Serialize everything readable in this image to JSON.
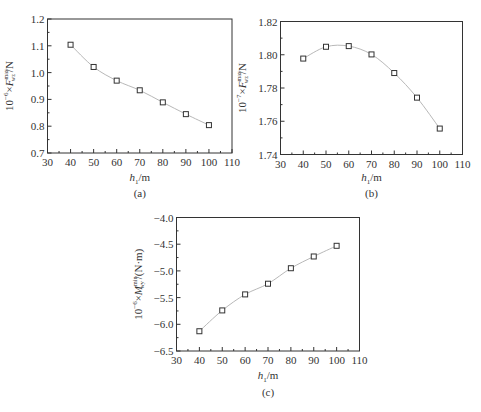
{
  "chart_data": [
    {
      "id": "a",
      "type": "line",
      "caption": "(a)",
      "xlabel": "h1/m",
      "xlabel_main": "h",
      "xlabel_sub": "1",
      "xlabel_unit": "/m",
      "ylabel": "10^-6 × F^max_wz / N",
      "ylabel_prefix": "10",
      "ylabel_exp": "−6",
      "ylabel_sym": "F",
      "ylabel_sup": "max",
      "ylabel_sub": "wz",
      "ylabel_unit": "/N",
      "xlim": [
        30,
        110
      ],
      "ylim": [
        0.7,
        1.2
      ],
      "xticks": [
        30,
        40,
        50,
        60,
        70,
        80,
        90,
        100,
        110
      ],
      "yticks": [
        "0.7",
        "0.8",
        "0.9",
        "1.0",
        "1.1",
        "1.2"
      ],
      "x": [
        40,
        50,
        60,
        70,
        80,
        90,
        100
      ],
      "values": [
        1.104,
        1.021,
        0.97,
        0.934,
        0.889,
        0.845,
        0.804
      ],
      "grid": false,
      "marker": "square"
    },
    {
      "id": "b",
      "type": "line",
      "caption": "(b)",
      "xlabel": "h1/m",
      "xlabel_main": "h",
      "xlabel_sub": "1",
      "xlabel_unit": "/m",
      "ylabel": "10^-7 × F^max_wz / N",
      "ylabel_prefix": "10",
      "ylabel_exp": "−7",
      "ylabel_sym": "F",
      "ylabel_sup": "max",
      "ylabel_sub": "wz",
      "ylabel_unit": "/N",
      "xlim": [
        30,
        110
      ],
      "ylim": [
        1.74,
        1.82
      ],
      "xticks": [
        30,
        40,
        50,
        60,
        70,
        80,
        90,
        100,
        110
      ],
      "yticks": [
        "1.74",
        "1.76",
        "1.78",
        "1.80",
        "1.82"
      ],
      "x": [
        40,
        50,
        60,
        70,
        80,
        90,
        100
      ],
      "values": [
        1.7977,
        1.8048,
        1.8052,
        1.8002,
        1.789,
        1.7742,
        1.7556
      ],
      "grid": false,
      "marker": "square"
    },
    {
      "id": "c",
      "type": "line",
      "caption": "(c)",
      "xlabel": "h1/m",
      "xlabel_main": "h",
      "xlabel_sub": "1",
      "xlabel_unit": "/m",
      "ylabel": "10^-6 × M^min_wy / (N·m)",
      "ylabel_prefix": "10",
      "ylabel_exp": "−6",
      "ylabel_sym": "M",
      "ylabel_sup": "min",
      "ylabel_sub": "wy",
      "ylabel_unit": "/(N·m)",
      "xlim": [
        30,
        110
      ],
      "ylim": [
        -6.5,
        -4.0
      ],
      "xticks": [
        30,
        40,
        50,
        60,
        70,
        80,
        90,
        100,
        110
      ],
      "yticks": [
        "−6.5",
        "−6.0",
        "−5.5",
        "−5.0",
        "−4.5",
        "−4.0"
      ],
      "x": [
        40,
        50,
        60,
        70,
        80,
        90,
        100
      ],
      "values": [
        -6.13,
        -5.74,
        -5.44,
        -5.24,
        -4.95,
        -4.73,
        -4.53
      ],
      "grid": false,
      "marker": "square"
    }
  ],
  "colors": {
    "axis": "#333333",
    "line": "#b8b8b8",
    "marker": "#333333"
  }
}
